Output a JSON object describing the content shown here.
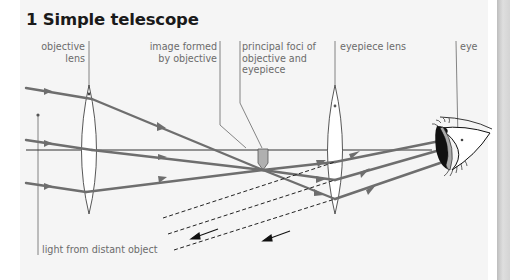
{
  "figure": {
    "title": "1 Simple telescope",
    "labels": {
      "objective_lens": "objective\nlens",
      "image_formed": "image formed\nby objective",
      "principal_foci": "principal foci of\nobjective and\neyepiece",
      "eyepiece_lens": "eyepiece lens",
      "eye": "eye",
      "light_source": "light from distant object"
    },
    "colors": {
      "ray": "#6e6e6e",
      "axis": "#333333",
      "lens_outline": "#444444",
      "image_fill": "#b0b0b0",
      "leader": "#777777",
      "background": "#f5f5f5"
    }
  }
}
